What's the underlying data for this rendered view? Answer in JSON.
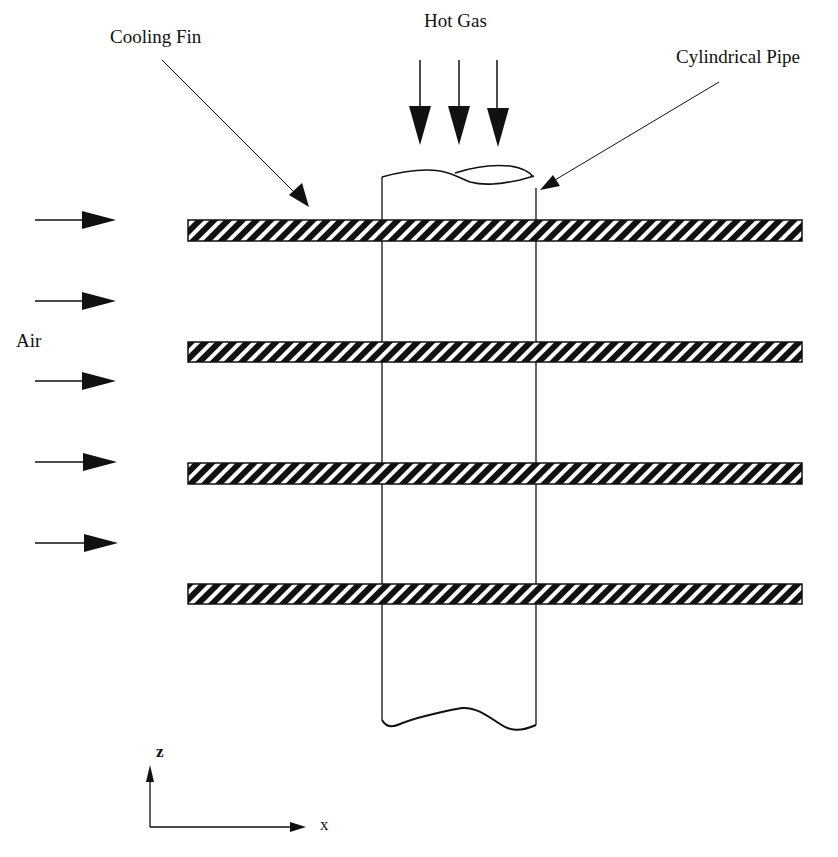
{
  "diagram": {
    "labels": {
      "cooling_fin": "Cooling Fin",
      "hot_gas": "Hot Gas",
      "cylindrical_pipe": "Cylindrical Pipe",
      "air": "Air",
      "axis_z": "z",
      "axis_x": "x"
    },
    "fins": [
      {
        "y": 220,
        "height": 21
      },
      {
        "y": 342,
        "height": 20
      },
      {
        "y": 463,
        "height": 21
      },
      {
        "y": 584,
        "height": 20
      }
    ],
    "fin_extent": {
      "x_start": 188,
      "x_end": 802
    },
    "pipe": {
      "x_left": 382,
      "x_right": 536,
      "top": 177,
      "bottom": 725
    },
    "air_arrows_y": [
      220,
      300,
      380,
      462,
      542
    ],
    "hot_gas_arrows_x": [
      420,
      459,
      498
    ],
    "colors": {
      "ink": "#111111",
      "background": "#ffffff"
    }
  }
}
